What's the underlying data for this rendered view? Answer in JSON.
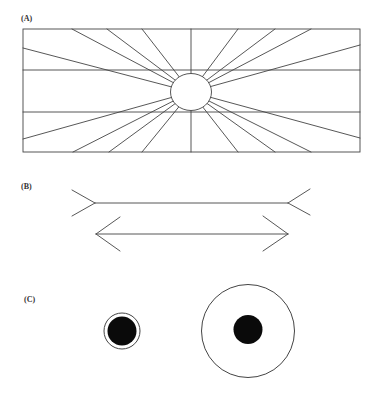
{
  "panels": {
    "a": {
      "label": "(A)",
      "name": "Hering illusion",
      "rect": {
        "x": 23,
        "y": 29,
        "w": 337,
        "h": 123
      },
      "center": {
        "x": 191,
        "y": 92
      },
      "circle": {
        "rx": 20.5,
        "ry": 18.5
      },
      "horizontal_lines_y": [
        70,
        112
      ],
      "ray_endpoints": [
        [
          72,
          29
        ],
        [
          107,
          29
        ],
        [
          142,
          29
        ],
        [
          191,
          29
        ],
        [
          238,
          29
        ],
        [
          275,
          29
        ],
        [
          311,
          29
        ],
        [
          360,
          45
        ],
        [
          360,
          138
        ],
        [
          311,
          152
        ],
        [
          275,
          152
        ],
        [
          238,
          152
        ],
        [
          191,
          152
        ],
        [
          142,
          152
        ],
        [
          109,
          152
        ],
        [
          73,
          152
        ],
        [
          23,
          139
        ],
        [
          23,
          48
        ]
      ]
    },
    "b": {
      "label": "(B)",
      "name": "Muller-Lyer illusion",
      "fins_out": {
        "x1": 95,
        "x2": 288,
        "y": 203,
        "fin_dx": 23,
        "fin_dy": 13
      },
      "fins_in": {
        "x1": 96,
        "x2": 288,
        "y": 234,
        "fin_dx": 24,
        "fin_dy": 17
      }
    },
    "c": {
      "label": "(C)",
      "name": "Delboeuf illusion",
      "small": {
        "cx": 122,
        "cy": 331,
        "ring_r": 18,
        "disk_r": 14.5
      },
      "large": {
        "cx": 248,
        "cy": 331,
        "ring_r": 46.5,
        "disk_r": 14.5
      }
    }
  },
  "colors": {
    "stroke": "#444444",
    "fill_dark": "#0a0a0a",
    "background": "#ffffff"
  }
}
